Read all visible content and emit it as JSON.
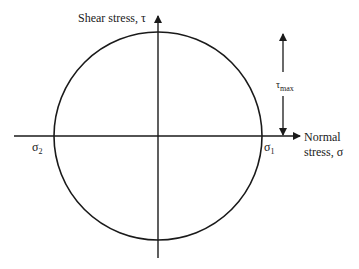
{
  "diagram": {
    "colors": {
      "stroke": "#1a1a1a",
      "background": "#ffffff"
    },
    "axes": {
      "vertical": {
        "label": "Shear stress, τ"
      },
      "horizontal": {
        "label_line1": "Normal",
        "label_line2": "stress, σ"
      }
    },
    "points": {
      "sigma2": {
        "symbol": "σ",
        "sub": "2"
      },
      "sigma1": {
        "symbol": "σ",
        "sub": "1"
      }
    },
    "dimension": {
      "symbol": "τ",
      "sub": "max"
    }
  }
}
